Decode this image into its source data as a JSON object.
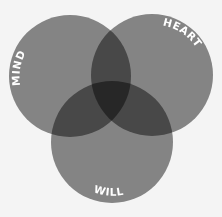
{
  "diagram": {
    "type": "venn",
    "background": "#f4f4f4",
    "circle_color": "#8a8a8a",
    "label_color": "#ffffff",
    "circles": [
      {
        "id": "mind",
        "label": "MIND",
        "cx": 70,
        "cy": 76,
        "r": 61
      },
      {
        "id": "heart",
        "label": "HEART",
        "cx": 152,
        "cy": 75,
        "r": 61
      },
      {
        "id": "will",
        "label": "WILL",
        "cx": 112,
        "cy": 142,
        "r": 61
      }
    ]
  }
}
